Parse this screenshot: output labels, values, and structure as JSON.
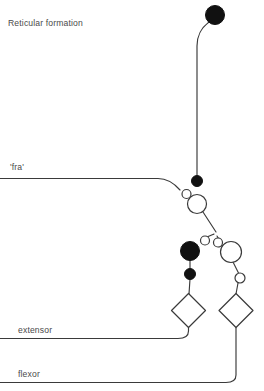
{
  "figure": {
    "background_color": "#ffffff",
    "stroke_color": "#3a3a3a",
    "fill_node_color": "#111111",
    "open_node_fill": "#ffffff",
    "text_color": "#4a4a4a"
  },
  "labels": {
    "reticular_formation": "Reticular formation",
    "fra": "'fra'",
    "extensor": "extensor",
    "flexor": "flexor"
  },
  "diagram_data": {
    "type": "neural-circuit-diagram",
    "nodes": [
      {
        "id": "rf-soma",
        "shape": "circle-filled",
        "cx": 215,
        "cy": 15,
        "r": 9.5
      },
      {
        "id": "descending-terminal",
        "shape": "circle-filled",
        "cx": 197,
        "cy": 181,
        "r": 5.5
      },
      {
        "id": "fra-terminal",
        "shape": "circle-open",
        "cx": 186.5,
        "cy": 194,
        "r": 4.5
      },
      {
        "id": "interneuron-upper",
        "shape": "circle-open",
        "cx": 197,
        "cy": 204,
        "r": 9.5
      },
      {
        "id": "branch-terminal-a",
        "shape": "circle-open",
        "cx": 205,
        "cy": 240.5,
        "r": 4.5
      },
      {
        "id": "branch-terminal-b",
        "shape": "circle-open",
        "cx": 218,
        "cy": 242.5,
        "r": 4.5
      },
      {
        "id": "inhibitory-soma",
        "shape": "circle-filled",
        "cx": 190,
        "cy": 251,
        "r": 9.5
      },
      {
        "id": "inhibitory-terminal",
        "shape": "circle-filled",
        "cx": 190,
        "cy": 274,
        "r": 5.5
      },
      {
        "id": "interneuron-lower",
        "shape": "circle-open",
        "cx": 231,
        "cy": 252,
        "r": 10.5
      },
      {
        "id": "lower-terminal",
        "shape": "circle-open",
        "cx": 240,
        "cy": 278,
        "r": 5
      },
      {
        "id": "extensor-motoneuron",
        "shape": "diamond",
        "cx": 188.5,
        "cy": 310.5,
        "size": 17
      },
      {
        "id": "flexor-motoneuron",
        "shape": "diamond",
        "cx": 236,
        "cy": 310.5,
        "size": 17
      }
    ],
    "axes": [
      {
        "id": "fra-afferent",
        "label": "'fra'",
        "y": 178.5
      },
      {
        "id": "extensor-axon",
        "label": "extensor",
        "y": 338.5
      },
      {
        "id": "flexor-axon",
        "label": "flexor",
        "y": 382.5
      }
    ]
  },
  "label_positions": {
    "reticular_formation": {
      "x": 8,
      "y": 26
    },
    "fra": {
      "x": 10,
      "y": 170
    },
    "extensor": {
      "x": 18,
      "y": 333
    },
    "flexor": {
      "x": 18,
      "y": 377
    }
  }
}
